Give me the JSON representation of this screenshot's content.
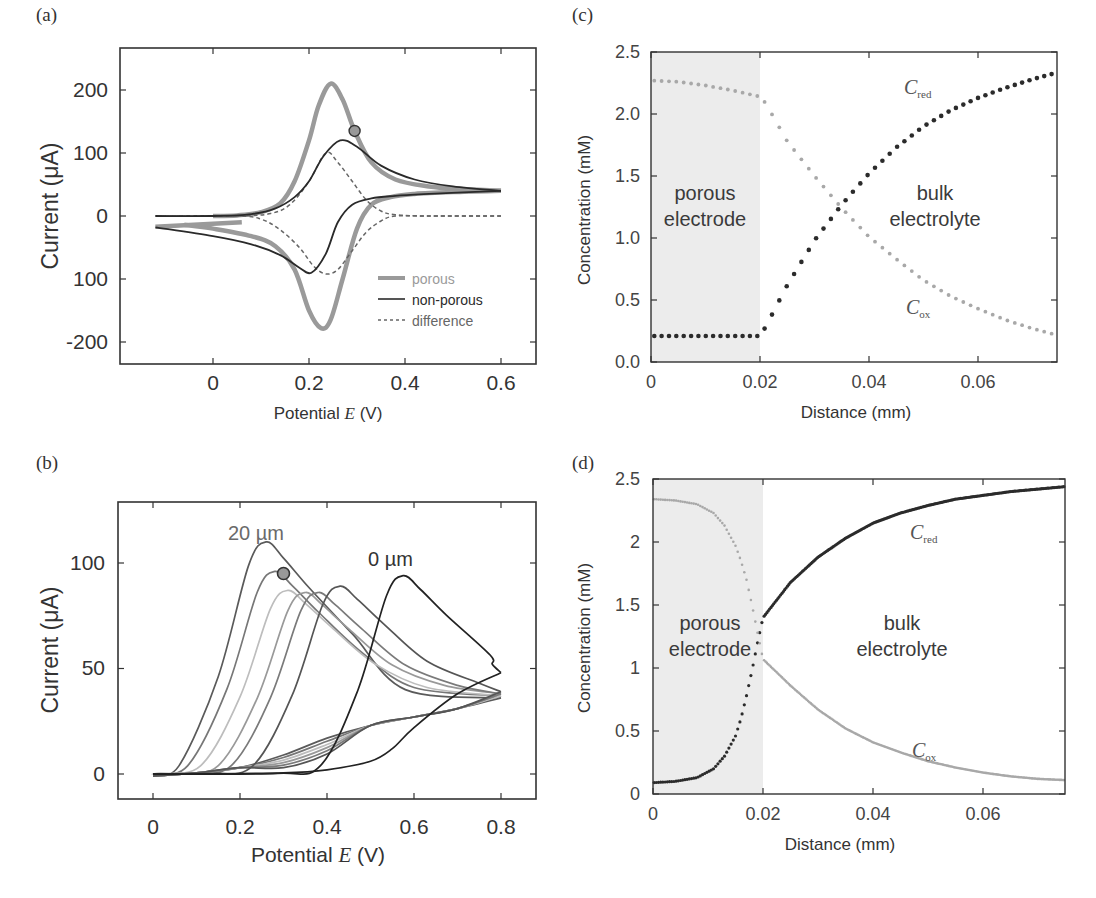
{
  "panels": {
    "a": {
      "label": "(a)",
      "ylabel": "Current (μA)",
      "xlabel_prefix": "Potential ",
      "xlabel_var": "E",
      "xlabel_suffix": " (V)",
      "yticks": [
        "200",
        "100",
        "0",
        "100",
        "-200"
      ],
      "xticks": [
        "0",
        "0.2",
        "0.4",
        "0.6"
      ],
      "legend": [
        "porous",
        "non-porous",
        "difference"
      ]
    },
    "b": {
      "label": "(b)",
      "ylabel": "Current (μA)",
      "xlabel_prefix": "Potential ",
      "xlabel_var": "E",
      "xlabel_suffix": " (V)",
      "yticks": [
        "100",
        "50",
        "0"
      ],
      "xticks": [
        "0",
        "0.2",
        "0.4",
        "0.6",
        "0.8"
      ],
      "annotation_20": "20 µm",
      "annotation_0": "0 µm"
    },
    "c": {
      "label": "(c)",
      "ylabel": "Concentration (mM)",
      "xlabel": "Distance (mm)",
      "yticks": [
        "2.5",
        "2.0",
        "1.5",
        "1.0",
        "0.5",
        "0.0"
      ],
      "xticks": [
        "0",
        "0.02",
        "0.04",
        "0.06"
      ],
      "region_left_1": "porous",
      "region_left_2": "electrode",
      "region_right_1": "bulk",
      "region_right_2": "electrolyte",
      "cred_main": "C",
      "cred_sub": "red",
      "cox_main": "C",
      "cox_sub": "ox"
    },
    "d": {
      "label": "(d)",
      "ylabel": "Concentration (mM)",
      "xlabel": "Distance (mm)",
      "yticks": [
        "2.5",
        "2",
        "1.5",
        "1",
        "0.5",
        "0"
      ],
      "xticks": [
        "0",
        "0.02",
        "0.04",
        "0.06"
      ],
      "region_left_1": "porous",
      "region_left_2": "electrode",
      "region_right_1": "bulk",
      "region_right_2": "electrolyte",
      "cred_main": "C",
      "cred_sub": "red",
      "cox_main": "C",
      "cox_sub": "ox"
    }
  },
  "colors": {
    "porous": "#9a9a9a",
    "nonporous": "#2a2a2a",
    "difference": "#666666",
    "cred": "#2b2b2b",
    "cox": "#a8a8a8",
    "shade": "#ececec",
    "axis": "#333333"
  },
  "chart_data": [
    {
      "panel": "a",
      "type": "line",
      "title": "",
      "xlabel": "Potential E (V)",
      "ylabel": "Current (μA)",
      "xlim": [
        -0.19,
        0.67
      ],
      "ylim": [
        -235,
        267
      ],
      "xticks": [
        0,
        0.2,
        0.4,
        0.6
      ],
      "yticks": [
        200,
        100,
        0,
        -100,
        -200
      ],
      "ytick_labels": [
        "200",
        "100",
        "0",
        "100",
        "-200"
      ],
      "legend_position": "lower right",
      "grid": false,
      "series": [
        {
          "name": "porous",
          "style": "thick gray solid",
          "forward": {
            "x": [
              0.0,
              0.05,
              0.1,
              0.14,
              0.17,
              0.2,
              0.22,
              0.245,
              0.27,
              0.295,
              0.33,
              0.38,
              0.45,
              0.52,
              0.6
            ],
            "y": [
              0,
              1,
              6,
              20,
              55,
              120,
              175,
              210,
              185,
              135,
              85,
              58,
              47,
              43,
              40
            ]
          },
          "reverse": {
            "x": [
              0.6,
              0.5,
              0.42,
              0.37,
              0.33,
              0.3,
              0.27,
              0.245,
              0.225,
              0.2,
              0.17,
              0.13,
              0.08,
              0.0,
              -0.06
            ],
            "y": [
              40,
              38,
              35,
              30,
              18,
              -20,
              -100,
              -165,
              -178,
              -150,
              -85,
              -48,
              -32,
              -20,
              -14
            ]
          },
          "tail": {
            "x": [
              -0.12,
              0.06
            ],
            "y": [
              -17,
              -10
            ]
          }
        },
        {
          "name": "non-porous",
          "style": "black solid",
          "forward": {
            "x": [
              -0.12,
              0.0,
              0.08,
              0.13,
              0.17,
              0.2,
              0.23,
              0.265,
              0.3,
              0.35,
              0.42,
              0.5,
              0.6
            ],
            "y": [
              0,
              0,
              3,
              12,
              30,
              55,
              95,
              120,
              110,
              80,
              58,
              47,
              40
            ]
          },
          "reverse": {
            "x": [
              0.6,
              0.45,
              0.38,
              0.33,
              0.29,
              0.26,
              0.235,
              0.205,
              0.18,
              0.14,
              0.08,
              0.0,
              -0.12
            ],
            "y": [
              40,
              35,
              32,
              28,
              18,
              -10,
              -60,
              -90,
              -82,
              -62,
              -45,
              -32,
              -18
            ]
          }
        },
        {
          "name": "difference",
          "style": "gray dashed",
          "forward": {
            "x": [
              -0.12,
              0.05,
              0.12,
              0.16,
              0.2,
              0.235,
              0.26,
              0.29,
              0.32,
              0.35,
              0.38,
              0.45,
              0.6
            ],
            "y": [
              0,
              0,
              4,
              18,
              55,
              100,
              85,
              55,
              25,
              8,
              2,
              0,
              0
            ]
          },
          "reverse": {
            "x": [
              0.6,
              0.45,
              0.38,
              0.35,
              0.32,
              0.29,
              0.26,
              0.235,
              0.21,
              0.18,
              0.14,
              0.1,
              0.05,
              -0.12
            ],
            "y": [
              0,
              0,
              0,
              -8,
              -25,
              -55,
              -85,
              -92,
              -80,
              -50,
              -22,
              -5,
              0,
              0
            ]
          }
        }
      ],
      "annotations": [
        {
          "type": "circle",
          "x": 0.295,
          "y": 135
        }
      ]
    },
    {
      "panel": "b",
      "type": "line",
      "title": "",
      "xlabel": "Potential E (V)",
      "ylabel": "Current (μA)",
      "xlim": [
        -0.08,
        0.88
      ],
      "ylim": [
        -12,
        129
      ],
      "xticks": [
        0,
        0.2,
        0.4,
        0.6,
        0.8
      ],
      "yticks": [
        100,
        50,
        0
      ],
      "grid": false,
      "series_description": "Family of CV forward/reverse scans for porous layer thickness from 20 µm (leftmost, peak ~110 at 0.26 V) to 0 µm (rightmost, peak ~94 at 0.575 V)",
      "series": [
        {
          "name": "20 µm",
          "peak_x": 0.26,
          "peak_y": 110,
          "shade": "#5a5a5a"
        },
        {
          "name": "~16 µm",
          "peak_x": 0.28,
          "peak_y": 96,
          "shade": "#777777"
        },
        {
          "name": "~12 µm",
          "peak_x": 0.31,
          "peak_y": 87,
          "shade": "#bdbdbd"
        },
        {
          "name": "~8 µm",
          "peak_x": 0.35,
          "peak_y": 86,
          "shade": "#999999"
        },
        {
          "name": "~4 µm",
          "peak_x": 0.38,
          "peak_y": 86,
          "shade": "#7a7a7a"
        },
        {
          "name": "~2 µm",
          "peak_x": 0.43,
          "peak_y": 89,
          "shade": "#555555"
        },
        {
          "name": "0 µm",
          "peak_x": 0.575,
          "peak_y": 94,
          "shade": "#222222"
        }
      ],
      "end_values_at_0.8V": [
        36,
        37,
        37,
        38,
        38,
        39,
        48
      ],
      "annotations": [
        {
          "type": "text",
          "text": "20 µm",
          "x": 0.27,
          "y": 116
        },
        {
          "type": "text",
          "text": "0 µm",
          "x": 0.57,
          "y": 101
        },
        {
          "type": "circle",
          "x": 0.3,
          "y": 95
        }
      ]
    },
    {
      "panel": "c",
      "type": "scatter",
      "title": "",
      "xlabel": "Distance (mm)",
      "ylabel": "Concentration (mM)",
      "xlim": [
        0,
        0.075
      ],
      "ylim": [
        0,
        2.5
      ],
      "xticks": [
        0,
        0.02,
        0.04,
        0.06
      ],
      "yticks": [
        0.0,
        0.5,
        1.0,
        1.5,
        2.0,
        2.5
      ],
      "shaded_region": {
        "x": [
          0,
          0.02
        ],
        "label": "porous electrode"
      },
      "region_labels": [
        "porous electrode",
        "bulk electrolyte"
      ],
      "grid": false,
      "series": [
        {
          "name": "C_red",
          "marker": "dark dots",
          "x": [
            0,
            0.005,
            0.01,
            0.015,
            0.02,
            0.021,
            0.025,
            0.03,
            0.035,
            0.04,
            0.045,
            0.05,
            0.055,
            0.06,
            0.065,
            0.07,
            0.075
          ],
          "y": [
            0.21,
            0.21,
            0.21,
            0.21,
            0.21,
            0.28,
            0.62,
            0.98,
            1.27,
            1.52,
            1.73,
            1.9,
            2.03,
            2.13,
            2.21,
            2.28,
            2.34
          ]
        },
        {
          "name": "C_ox",
          "marker": "light dots",
          "x": [
            0,
            0.005,
            0.01,
            0.015,
            0.02,
            0.021,
            0.025,
            0.03,
            0.035,
            0.04,
            0.045,
            0.05,
            0.055,
            0.06,
            0.065,
            0.07,
            0.075
          ],
          "y": [
            2.27,
            2.26,
            2.23,
            2.19,
            2.14,
            2.09,
            1.78,
            1.5,
            1.24,
            1.01,
            0.83,
            0.66,
            0.53,
            0.43,
            0.34,
            0.27,
            0.21
          ]
        }
      ]
    },
    {
      "panel": "d",
      "type": "scatter",
      "title": "",
      "xlabel": "Distance (mm)",
      "ylabel": "Concentration (mM)",
      "xlim": [
        0,
        0.075
      ],
      "ylim": [
        0,
        2.5
      ],
      "xticks": [
        0,
        0.02,
        0.04,
        0.06
      ],
      "yticks": [
        0,
        0.5,
        1,
        1.5,
        2,
        2.5
      ],
      "shaded_region": {
        "x": [
          0,
          0.02
        ],
        "label": "porous electrode"
      },
      "region_labels": [
        "porous electrode",
        "bulk electrolyte"
      ],
      "grid": false,
      "series": [
        {
          "name": "C_red",
          "marker": "dark dots",
          "x": [
            0,
            0.004,
            0.008,
            0.011,
            0.013,
            0.015,
            0.016,
            0.017,
            0.018,
            0.019,
            0.02,
            0.025,
            0.03,
            0.035,
            0.04,
            0.045,
            0.05,
            0.055,
            0.06,
            0.065,
            0.07,
            0.075
          ],
          "y": [
            0.09,
            0.1,
            0.13,
            0.2,
            0.3,
            0.46,
            0.6,
            0.78,
            0.98,
            1.2,
            1.4,
            1.68,
            1.88,
            2.03,
            2.15,
            2.23,
            2.29,
            2.34,
            2.37,
            2.4,
            2.42,
            2.44
          ]
        },
        {
          "name": "C_ox",
          "marker": "light dots",
          "x": [
            0,
            0.004,
            0.008,
            0.011,
            0.013,
            0.015,
            0.016,
            0.017,
            0.018,
            0.019,
            0.02,
            0.025,
            0.03,
            0.035,
            0.04,
            0.045,
            0.05,
            0.055,
            0.06,
            0.065,
            0.07,
            0.075
          ],
          "y": [
            2.34,
            2.33,
            2.3,
            2.23,
            2.13,
            1.97,
            1.85,
            1.7,
            1.5,
            1.28,
            1.07,
            0.86,
            0.67,
            0.52,
            0.41,
            0.33,
            0.26,
            0.21,
            0.17,
            0.14,
            0.12,
            0.11
          ]
        }
      ]
    }
  ]
}
